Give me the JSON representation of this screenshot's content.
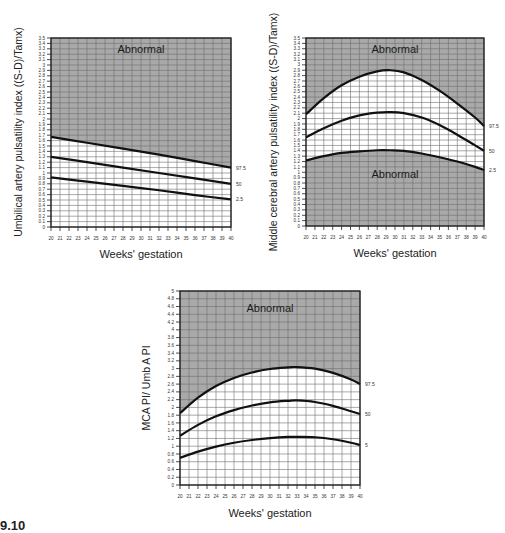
{
  "caption": "9.10",
  "chart_data": [
    {
      "type": "line",
      "id": "umbilical",
      "title": "",
      "xlabel": "Weeks' gestation",
      "ylabel": "Umbilical artery pulsatility index ((S-D)/Tamx)",
      "xlim": [
        20,
        40
      ],
      "ylim": [
        0,
        3.5
      ],
      "xticks": [
        20,
        21,
        22,
        23,
        24,
        25,
        26,
        27,
        28,
        29,
        30,
        31,
        32,
        33,
        34,
        35,
        36,
        37,
        38,
        39,
        40
      ],
      "yticks": [
        "0",
        "0.1",
        "0.2",
        "0.3",
        "0.4",
        "0.5",
        "0.6",
        "0.7",
        "0.8",
        "0.9",
        "1",
        "1.1",
        "1.2",
        "1.3",
        "1.4",
        "1.5",
        "1.6",
        "1.7",
        "1.8",
        "1.9",
        "2",
        "2.1",
        "2.2",
        "2.3",
        "2.4",
        "2.5",
        "2.6",
        "2.7",
        "2.8",
        "2.9",
        "3",
        "3.1",
        "3.2",
        "3.3",
        "3.4",
        "3.5"
      ],
      "grid": true,
      "annotations": [
        {
          "text": "Abnormal",
          "x": 30,
          "y": 3.3
        }
      ],
      "shade": "above_top",
      "x": [
        20,
        24,
        28,
        32,
        36,
        40
      ],
      "series": [
        {
          "name": "97.5",
          "values": [
            1.67,
            1.56,
            1.45,
            1.34,
            1.22,
            1.1
          ]
        },
        {
          "name": "50",
          "values": [
            1.3,
            1.2,
            1.1,
            1.0,
            0.9,
            0.8
          ]
        },
        {
          "name": "2.5",
          "values": [
            0.92,
            0.84,
            0.76,
            0.68,
            0.59,
            0.51
          ]
        }
      ],
      "box": {
        "left": 51,
        "top": 38,
        "width": 180,
        "height": 189
      },
      "ylabel_pos": {
        "x": 22,
        "y": 132
      },
      "xlabel_pos": {
        "x": 141,
        "y": 258
      },
      "series_label_x": 236
    },
    {
      "type": "line",
      "id": "mca",
      "title": "",
      "xlabel": "Weeks' gestation",
      "ylabel": "Middle cerebral artery pulsatility index ((S-D)/Tamx)",
      "xlim": [
        20,
        40
      ],
      "ylim": [
        0,
        3.5
      ],
      "xticks": [
        20,
        21,
        22,
        23,
        24,
        25,
        26,
        27,
        28,
        29,
        30,
        31,
        32,
        33,
        34,
        35,
        36,
        37,
        38,
        39,
        40
      ],
      "yticks": [
        "0",
        "0.1",
        "0.2",
        "0.3",
        "0.4",
        "0.5",
        "0.6",
        "0.7",
        "0.8",
        "0.9",
        "1",
        "1.1",
        "1.2",
        "1.3",
        "1.4",
        "1.5",
        "1.6",
        "1.7",
        "1.8",
        "1.9",
        "2",
        "2.1",
        "2.2",
        "2.3",
        "2.4",
        "2.5",
        "2.6",
        "2.7",
        "2.8",
        "2.9",
        "3",
        "3.1",
        "3.2",
        "3.3",
        "3.4",
        "3.5"
      ],
      "grid": true,
      "annotations": [
        {
          "text": "Abnormal",
          "x": 30,
          "y": 3.3
        },
        {
          "text": "Abnormal",
          "x": 30,
          "y": 0.97
        }
      ],
      "shade": "above_top_and_below_bottom",
      "x": [
        20,
        22,
        24,
        26,
        28,
        29.5,
        31,
        33,
        35,
        37,
        39,
        40
      ],
      "series": [
        {
          "name": "97.5",
          "values": [
            2.08,
            2.38,
            2.62,
            2.78,
            2.88,
            2.9,
            2.86,
            2.72,
            2.52,
            2.28,
            2.02,
            1.86
          ]
        },
        {
          "name": "50",
          "values": [
            1.65,
            1.82,
            1.96,
            2.06,
            2.11,
            2.12,
            2.1,
            2.02,
            1.88,
            1.7,
            1.5,
            1.4
          ]
        },
        {
          "name": "2.5",
          "values": [
            1.22,
            1.3,
            1.36,
            1.39,
            1.41,
            1.41,
            1.4,
            1.35,
            1.28,
            1.2,
            1.1,
            1.04
          ]
        }
      ],
      "box": {
        "left": 306,
        "top": 38,
        "width": 178,
        "height": 188
      },
      "ylabel_pos": {
        "x": 277,
        "y": 132
      },
      "xlabel_pos": {
        "x": 395,
        "y": 257
      },
      "series_label_x": 489
    },
    {
      "type": "line",
      "id": "ratio",
      "title": "",
      "xlabel": "Weeks' gestation",
      "ylabel": "MCA PI/ Umb A PI",
      "xlim": [
        20,
        40
      ],
      "ylim": [
        0,
        5
      ],
      "xticks": [
        20,
        21,
        22,
        23,
        24,
        25,
        26,
        27,
        28,
        29,
        30,
        31,
        32,
        33,
        34,
        35,
        36,
        37,
        38,
        39,
        40
      ],
      "yticks": [
        "0",
        "0.2",
        "0.4",
        "0.6",
        "0.8",
        "1",
        "1.2",
        "1.4",
        "1.6",
        "1.8",
        "2",
        "2.2",
        "2.4",
        "2.6",
        "2.8",
        "3",
        "3.2",
        "3.4",
        "3.6",
        "3.8",
        "4",
        "4.2",
        "4.4",
        "4.6",
        "4.8",
        "5"
      ],
      "grid": true,
      "annotations": [
        {
          "text": "Abnormal",
          "x": 30,
          "y": 4.55
        }
      ],
      "shade": "above_top",
      "x": [
        20,
        22,
        24,
        26,
        28,
        30,
        32,
        33,
        35,
        37,
        39,
        40
      ],
      "series": [
        {
          "name": "97.5",
          "values": [
            1.85,
            2.25,
            2.55,
            2.76,
            2.9,
            2.99,
            3.03,
            3.04,
            3.0,
            2.89,
            2.72,
            2.6
          ]
        },
        {
          "name": "50",
          "values": [
            1.27,
            1.55,
            1.77,
            1.93,
            2.05,
            2.13,
            2.17,
            2.18,
            2.14,
            2.04,
            1.9,
            1.83
          ]
        },
        {
          "name": "5",
          "values": [
            0.7,
            0.86,
            0.99,
            1.09,
            1.16,
            1.21,
            1.24,
            1.24,
            1.23,
            1.18,
            1.09,
            1.03
          ]
        }
      ],
      "box": {
        "left": 180,
        "top": 291,
        "width": 180,
        "height": 194
      },
      "ylabel_pos": {
        "x": 150,
        "y": 388
      },
      "xlabel_pos": {
        "x": 270,
        "y": 517
      },
      "series_label_x": 365
    }
  ]
}
